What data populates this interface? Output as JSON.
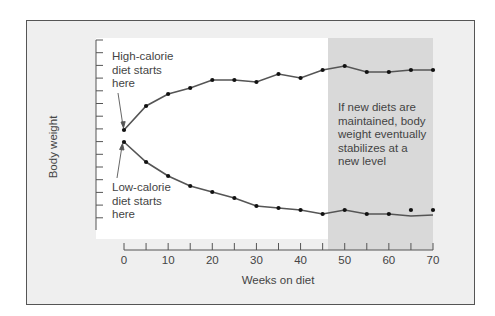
{
  "figure": {
    "annotations": {
      "high_start": "High-calorie\ndiet starts\nhere",
      "low_start": "Low-calorie\ndiet starts\nhere",
      "stabilize": "If new diets are\nmaintained, body\nweight eventually\nstabilizes at a\nnew level"
    },
    "xlabel": "Weeks on diet",
    "ylabel": "Body weight",
    "xticks": [
      "0",
      "10",
      "20",
      "30",
      "40",
      "50",
      "60",
      "70"
    ],
    "colors": {
      "frame_bg": "#efefef",
      "plot_bg": "#ffffff",
      "shade": "#d9d9d9",
      "line": "#555555",
      "point": "#111111",
      "text": "#444444"
    }
  },
  "chart_data": {
    "type": "line",
    "title": "",
    "xlabel": "Weeks on diet",
    "ylabel": "Body weight",
    "x": [
      0,
      5,
      10,
      15,
      20,
      25,
      30,
      35,
      40,
      45,
      50,
      55,
      60,
      65,
      70
    ],
    "xlim": [
      0,
      70
    ],
    "x_tick_labels": [
      "0",
      "10",
      "20",
      "30",
      "40",
      "50",
      "60",
      "70"
    ],
    "y_tick_labels": [],
    "y_units": "relative (no numeric labels shown)",
    "series": [
      {
        "name": "High-calorie diet",
        "values": [
          50,
          62,
          68,
          71,
          75,
          75,
          74,
          78,
          76,
          80,
          82,
          79,
          79,
          80,
          80
        ]
      },
      {
        "name": "Low-calorie diet",
        "values": [
          44,
          34,
          27,
          22,
          19,
          16,
          12,
          11,
          10,
          8,
          10,
          8,
          8,
          10,
          10
        ]
      }
    ],
    "shaded_region": {
      "x_start": 45,
      "x_end": 70,
      "label": "If new diets are maintained, body weight eventually stabilizes at a new level"
    },
    "annotations": [
      {
        "text": "High-calorie diet starts here",
        "x": 0,
        "series": "High-calorie diet"
      },
      {
        "text": "Low-calorie diet starts here",
        "x": 0,
        "series": "Low-calorie diet"
      }
    ],
    "grid": false,
    "legend": "none"
  }
}
